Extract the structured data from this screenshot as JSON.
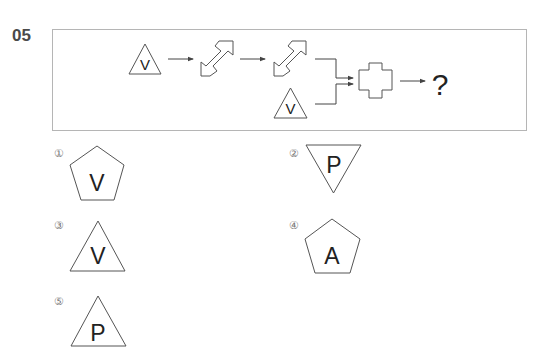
{
  "question": {
    "number": "05",
    "sequence": {
      "start_figure": {
        "shape": "triangle",
        "letter": "V"
      },
      "operator_1": "double-diagonal-arrow",
      "operator_2": "double-diagonal-arrow",
      "second_input": {
        "shape": "triangle",
        "letter": "V"
      },
      "combine_operator": "cross",
      "result": "?"
    }
  },
  "options": [
    {
      "marker": "①",
      "shape": "pentagon",
      "letter": "V"
    },
    {
      "marker": "②",
      "shape": "inverted-triangle",
      "letter": "P"
    },
    {
      "marker": "③",
      "shape": "triangle",
      "letter": "V"
    },
    {
      "marker": "④",
      "shape": "pentagon",
      "letter": "A"
    },
    {
      "marker": "⑤",
      "shape": "triangle",
      "letter": "P"
    }
  ],
  "colors": {
    "border": "#b5b5b5",
    "stroke": "#555555",
    "text": "#222222",
    "number": "#4a4a4a"
  }
}
